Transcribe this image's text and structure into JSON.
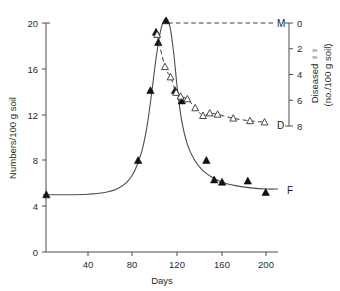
{
  "chart_data": {
    "type": "line",
    "title": "",
    "xlabel": "Days",
    "ylabel_left": "Numbers/100 g soil",
    "ylabel_right_line1": "Diseased ♀♀",
    "ylabel_right_line2": "(no./100 g soil)",
    "xlim": [
      0,
      210
    ],
    "ylim_left": [
      0,
      20
    ],
    "ylim_right": [
      0,
      8
    ],
    "right_axis_inverted": true,
    "grid": false,
    "legend_position": "inline-right-end-labels",
    "xticks": [
      40,
      80,
      120,
      160,
      200
    ],
    "xtick_labels": [
      "40",
      "80",
      "120",
      "160",
      "200"
    ],
    "yticks_left": [
      0,
      4,
      8,
      12,
      16,
      20
    ],
    "ytick_labels_left": [
      "0",
      "4",
      "8",
      "12",
      "16",
      "20"
    ],
    "yticks_right": [
      0,
      2,
      4,
      6,
      8
    ],
    "ytick_labels_right": [
      "0",
      "2",
      "4",
      "6",
      "8"
    ],
    "series": [
      {
        "name": "F",
        "label": "F",
        "axis": "left",
        "marker": "filled-triangle",
        "line": "solid",
        "description": "Female nematode numbers per 100 g soil",
        "points": [
          {
            "x": 3,
            "y": 5.0
          },
          {
            "x": 85,
            "y": 8.0
          },
          {
            "x": 96,
            "y": 14.1
          },
          {
            "x": 101,
            "y": 19.2
          },
          {
            "x": 103,
            "y": 18.3
          },
          {
            "x": 110,
            "y": 20.2
          },
          {
            "x": 118,
            "y": 14.1
          },
          {
            "x": 124,
            "y": 13.2
          },
          {
            "x": 146,
            "y": 8.0
          },
          {
            "x": 153,
            "y": 6.3
          },
          {
            "x": 160,
            "y": 6.1
          },
          {
            "x": 183,
            "y": 6.2
          },
          {
            "x": 199,
            "y": 5.2
          }
        ],
        "fitted_curve": [
          {
            "x": 0,
            "y": 5.0
          },
          {
            "x": 20,
            "y": 5.0
          },
          {
            "x": 40,
            "y": 5.05
          },
          {
            "x": 55,
            "y": 5.2
          },
          {
            "x": 66,
            "y": 5.5
          },
          {
            "x": 75,
            "y": 6.1
          },
          {
            "x": 82,
            "y": 7.1
          },
          {
            "x": 88,
            "y": 8.7
          },
          {
            "x": 93,
            "y": 11.0
          },
          {
            "x": 97,
            "y": 13.8
          },
          {
            "x": 101,
            "y": 16.9
          },
          {
            "x": 105,
            "y": 19.3
          },
          {
            "x": 108,
            "y": 20.2
          },
          {
            "x": 111,
            "y": 20.3
          },
          {
            "x": 114,
            "y": 19.4
          },
          {
            "x": 117,
            "y": 17.2
          },
          {
            "x": 120,
            "y": 14.3
          },
          {
            "x": 124,
            "y": 11.4
          },
          {
            "x": 129,
            "y": 9.4
          },
          {
            "x": 135,
            "y": 8.1
          },
          {
            "x": 142,
            "y": 7.2
          },
          {
            "x": 150,
            "y": 6.6
          },
          {
            "x": 160,
            "y": 6.1
          },
          {
            "x": 172,
            "y": 5.8
          },
          {
            "x": 186,
            "y": 5.6
          },
          {
            "x": 200,
            "y": 5.5
          },
          {
            "x": 210,
            "y": 5.5
          }
        ]
      },
      {
        "name": "D",
        "label": "D",
        "axis": "right",
        "marker": "open-triangle",
        "line": "dashed",
        "description": "Diseased females per 100 g soil (right axis, inverted)",
        "points": [
          {
            "x": 102,
            "y": 0.9
          },
          {
            "x": 109,
            "y": 3.4
          },
          {
            "x": 114,
            "y": 4.2
          },
          {
            "x": 119,
            "y": 5.4
          },
          {
            "x": 123,
            "y": 5.7
          },
          {
            "x": 129,
            "y": 5.9
          },
          {
            "x": 136,
            "y": 6.6
          },
          {
            "x": 143,
            "y": 7.2
          },
          {
            "x": 149,
            "y": 7.0
          },
          {
            "x": 156,
            "y": 7.1
          },
          {
            "x": 170,
            "y": 7.4
          },
          {
            "x": 185,
            "y": 7.6
          },
          {
            "x": 198,
            "y": 7.7
          }
        ]
      },
      {
        "name": "M",
        "label": "M",
        "axis": "right",
        "marker": "none",
        "line": "dashed",
        "description": "Male nematodes, flat at 0 on right axis",
        "points": [
          {
            "x": 112,
            "y": 0.0
          },
          {
            "x": 208,
            "y": 0.0
          }
        ]
      }
    ],
    "series_end_labels": [
      {
        "label": "M",
        "x": 209,
        "axis": "right",
        "y": 0.0
      },
      {
        "label": "D",
        "x": 209,
        "axis": "right",
        "y": 7.85
      },
      {
        "label": "F",
        "x": 209,
        "axis": "left",
        "y": 5.5
      }
    ]
  }
}
